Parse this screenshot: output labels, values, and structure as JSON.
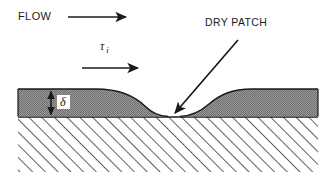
{
  "figure": {
    "background_color": "#ffffff",
    "line_color": "#1a1a1a",
    "film_fill_color": "#808080",
    "substrate_hatch_color": "#1a1a1a",
    "width": 333,
    "height": 177
  },
  "labels": {
    "flow": "FLOW",
    "dry_patch": "DRY PATCH",
    "shear_stress": "τ",
    "shear_stress_subscript": "i",
    "film_thickness": "δ"
  },
  "annotations": {
    "flow_arrow": {
      "name": "flow-direction-arrow",
      "x1": 68,
      "y1": 17,
      "x2": 128,
      "y2": 17,
      "direction": "right"
    },
    "shear_arrow": {
      "name": "shear-direction-arrow",
      "x1": 82,
      "y1": 68,
      "x2": 140,
      "y2": 68,
      "direction": "right"
    },
    "dry_patch_pointer": {
      "name": "dry-patch-pointer-arrow",
      "x1": 238,
      "y1": 40,
      "x2": 173,
      "y2": 115,
      "direction": "down-left"
    },
    "thickness_arrow": {
      "name": "film-thickness-dimension-arrow",
      "x": 51,
      "y1": 90,
      "y2": 117,
      "direction": "both"
    }
  },
  "geometry": {
    "film_left_edge": 18,
    "film_right_edge": 318,
    "film_top_y": 89,
    "wall_y": 117,
    "substrate_bottom_y": 172,
    "dry_patch_center_x": 174,
    "dry_patch_left_contact_x": 168,
    "dry_patch_right_contact_x": 180
  }
}
